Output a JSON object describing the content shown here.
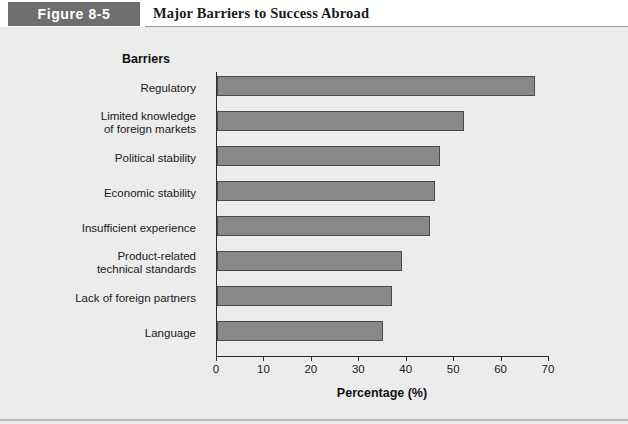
{
  "header": {
    "figure_label": "Figure 8-5",
    "title": "Major Barriers to Success Abroad",
    "label_box_color": "#6e6e6e"
  },
  "chart_data": {
    "type": "bar",
    "orientation": "horizontal",
    "title": "Major Barriers to Success Abroad",
    "axis_heading": "Barriers",
    "xlabel": "Percentage (%)",
    "ylabel": "Barriers",
    "xlim": [
      0,
      70
    ],
    "xticks": [
      0,
      10,
      20,
      30,
      40,
      50,
      60,
      70
    ],
    "xtick_labels": [
      "0",
      "10",
      "20",
      "30",
      "40",
      "50",
      "60",
      "70"
    ],
    "grid": false,
    "legend": false,
    "bar_color": "#888889",
    "bar_edge_color": "#4a4a4b",
    "background_color": "#ececed",
    "categories": [
      "Regulatory",
      "Limited knowledge of foreign markets",
      "Political stability",
      "Economic stability",
      "Insufficient experience",
      "Product-related technical standards",
      "Lack of foreign partners",
      "Language"
    ],
    "category_lines": [
      [
        "Regulatory"
      ],
      [
        "Limited knowledge",
        "of foreign markets"
      ],
      [
        "Political stability"
      ],
      [
        "Economic stability"
      ],
      [
        "Insufficient experience"
      ],
      [
        "Product-related",
        "technical standards"
      ],
      [
        "Lack of foreign partners"
      ],
      [
        "Language"
      ]
    ],
    "values": [
      67,
      52,
      47,
      46,
      45,
      39,
      37,
      35
    ]
  }
}
